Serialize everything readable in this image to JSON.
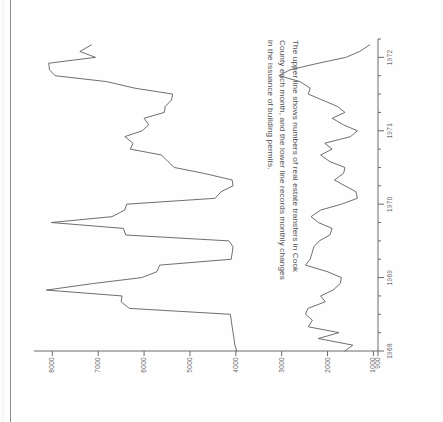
{
  "figure": {
    "caption_lines": [
      "The upper line shows numbers of real estate transfers in Cook",
      "County each month, and the lower line records monthly changes",
      "in the issuance of building permits."
    ],
    "orientation": "rotated-90-ccw",
    "ink_color": "#555555",
    "axis_color": "#6a6a6a",
    "paper_color": "#fefefe"
  },
  "chart_data": {
    "type": "line",
    "title": "",
    "subtitle": "",
    "xlabel": "",
    "ylabel": "",
    "grid": false,
    "legend": "none",
    "xlim": [
      1968.0,
      1972.25
    ],
    "ylim": [
      900,
      8400
    ],
    "yticks": [
      8000,
      7000,
      6000,
      5000,
      4000,
      3000,
      2000,
      1000,
      900
    ],
    "ytick_labels": [
      "8000",
      "7000",
      "6000",
      "5000",
      "4000",
      "3000",
      "2000",
      "1000",
      "900"
    ],
    "xticks": [
      1968,
      1969,
      1970,
      1971,
      1972
    ],
    "xtick_labels": [
      "1968",
      "1969",
      "1970",
      "1971",
      "1972"
    ],
    "x_minor_ticks_per_year": 4,
    "series": [
      {
        "name": "Real estate transfers in Cook County (monthly)",
        "x": [
          1968.0,
          1968.08,
          1968.17,
          1968.25,
          1968.33,
          1968.42,
          1968.5,
          1968.58,
          1968.67,
          1968.75,
          1968.83,
          1968.92,
          1969.0,
          1969.08,
          1969.17,
          1969.25,
          1969.33,
          1969.42,
          1969.5,
          1969.58,
          1969.67,
          1969.75,
          1969.83,
          1969.92,
          1970.0,
          1970.08,
          1970.17,
          1970.25,
          1970.33,
          1970.42,
          1970.5,
          1970.58,
          1970.67,
          1970.75,
          1970.83,
          1970.92,
          1971.0,
          1971.08,
          1971.17,
          1971.25,
          1971.33,
          1971.42,
          1971.5,
          1971.58,
          1971.67,
          1971.75,
          1971.83,
          1971.92,
          1972.0,
          1972.08,
          1972.17
        ],
        "values": [
          3980,
          4020,
          4040,
          4060,
          4080,
          4100,
          4120,
          6320,
          6500,
          6480,
          8130,
          7100,
          6050,
          5720,
          5660,
          4100,
          4080,
          4060,
          4150,
          6400,
          6450,
          8020,
          6700,
          6420,
          6380,
          4450,
          4320,
          4060,
          4080,
          4700,
          5340,
          5480,
          5620,
          6300,
          6240,
          6420,
          6040,
          5900,
          6000,
          5560,
          5540,
          5400,
          5380,
          6200,
          6820,
          7940,
          8060,
          8080,
          7060,
          7400,
          7150
        ]
      },
      {
        "name": "Monthly change in issuance of building permits",
        "x": [
          1968.0,
          1968.08,
          1968.17,
          1968.25,
          1968.33,
          1968.42,
          1968.5,
          1968.58,
          1968.67,
          1968.75,
          1968.83,
          1968.92,
          1969.0,
          1969.08,
          1969.17,
          1969.25,
          1969.33,
          1969.42,
          1969.5,
          1969.58,
          1969.67,
          1969.75,
          1969.83,
          1969.92,
          1970.0,
          1970.08,
          1970.17,
          1970.25,
          1970.33,
          1970.42,
          1970.5,
          1970.58,
          1970.67,
          1970.75,
          1970.83,
          1970.92,
          1971.0,
          1971.08,
          1971.17,
          1971.25,
          1971.33,
          1971.42,
          1971.5,
          1971.58,
          1971.67,
          1971.75,
          1971.83,
          1971.92,
          1972.0,
          1972.08,
          1972.17
        ],
        "values": [
          1620,
          1450,
          2200,
          1750,
          2420,
          2330,
          2480,
          2430,
          2050,
          2150,
          1880,
          1720,
          1700,
          2000,
          2480,
          2380,
          2340,
          2300,
          2180,
          1950,
          1900,
          2200,
          2360,
          2150,
          1700,
          1350,
          1380,
          1620,
          1850,
          1650,
          1620,
          1950,
          2150,
          1900,
          2060,
          1500,
          1350,
          1650,
          1900,
          1620,
          1780,
          2120,
          2420,
          2380,
          2600,
          3060,
          2820,
          2200,
          1600,
          1300,
          1080
        ]
      }
    ]
  }
}
